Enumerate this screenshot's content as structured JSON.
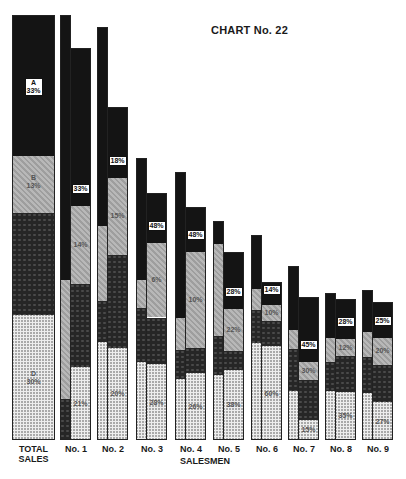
{
  "chart_data": {
    "type": "bar",
    "title": "CHART No. 22",
    "xlabel": "SALESMEN",
    "ylabel": "",
    "stacked": true,
    "segment_order_top_to_bottom": [
      "A",
      "B",
      "C",
      "D"
    ],
    "legend": [],
    "categories": [
      "TOTAL SALES",
      "No. 1",
      "No. 2",
      "No. 3",
      "No. 4",
      "No. 5",
      "No. 6",
      "No. 7",
      "No. 8",
      "No. 9"
    ],
    "series": [
      {
        "name": "A",
        "values": [
          33,
          33,
          18,
          48,
          48,
          28,
          14,
          45,
          28,
          25
        ]
      },
      {
        "name": "B",
        "values": [
          13,
          14,
          15,
          6,
          10,
          22,
          10,
          30,
          12,
          20
        ]
      },
      {
        "name": "C",
        "values": [
          24,
          32,
          47,
          18,
          16,
          12,
          16,
          10,
          25,
          28
        ]
      },
      {
        "name": "D",
        "values": [
          30,
          21,
          20,
          28,
          26,
          38,
          60,
          15,
          35,
          27
        ]
      }
    ],
    "labels": {
      "total_sales": [
        "A 33%",
        "B 13%",
        "",
        "D 30%"
      ],
      "No. 1": [
        "33%",
        "14%",
        "",
        "21%"
      ],
      "No. 2": [
        "18%",
        "15%",
        "",
        "20%"
      ],
      "No. 3": [
        "48%",
        "6%",
        "",
        "28%"
      ],
      "No. 4": [
        "48%",
        "10%",
        "",
        "26%"
      ],
      "No. 5": [
        "28%",
        "22%",
        "",
        "38%"
      ],
      "No. 6": [
        "14%",
        "10%",
        "",
        "60%"
      ],
      "No. 7": [
        "45%",
        "30%",
        "",
        "15%"
      ],
      "No. 8": [
        "28%",
        "12%",
        "",
        "35%"
      ],
      "No. 9": [
        "25%",
        "20%",
        "",
        "27%"
      ]
    }
  },
  "title": "CHART No. 22",
  "xaxis_label": "SALESMEN",
  "total_label": [
    "TOTAL",
    "SALES"
  ],
  "bars": [
    {
      "name": "No. 1",
      "narrow": {
        "top": 15,
        "segs": [
          [
            "A",
            0,
            0.62
          ],
          [
            "B",
            0.62,
            0.9
          ],
          [
            "C",
            0.9,
            1.0
          ]
        ]
      },
      "wide": {
        "top": 48,
        "segs": [
          [
            "A",
            0,
            0.4
          ],
          [
            "B",
            0.4,
            0.6
          ],
          [
            "C",
            0.6,
            0.81
          ],
          [
            "D",
            0.81,
            1.0
          ]
        ]
      },
      "l1": "33%",
      "l2": "14%",
      "l4": "21%"
    },
    {
      "name": "No. 2",
      "narrow": {
        "top": 27,
        "segs": [
          [
            "A",
            0,
            0.48
          ],
          [
            "B",
            0.48,
            0.66
          ],
          [
            "C",
            0.66,
            0.76
          ],
          [
            "D",
            0.76,
            1.0
          ]
        ]
      },
      "wide": {
        "top": 107,
        "segs": [
          [
            "A",
            0,
            0.21
          ],
          [
            "B",
            0.21,
            0.44
          ],
          [
            "C",
            0.44,
            0.72
          ],
          [
            "D",
            0.72,
            1.0
          ]
        ]
      },
      "l1": "18%",
      "l2": "15%",
      "l4": "20%"
    },
    {
      "name": "No. 3",
      "narrow": {
        "top": 158,
        "segs": [
          [
            "A",
            0,
            0.43
          ],
          [
            "B",
            0.43,
            0.53
          ],
          [
            "C",
            0.53,
            0.72
          ],
          [
            "D",
            0.72,
            1.0
          ]
        ]
      },
      "wide": {
        "top": 193,
        "segs": [
          [
            "A",
            0,
            0.2
          ],
          [
            "B",
            0.2,
            0.5
          ],
          [
            "C",
            0.5,
            0.69
          ],
          [
            "D",
            0.69,
            1.0
          ]
        ]
      },
      "l1": "48%",
      "l2": "6%",
      "l4": "28%"
    },
    {
      "name": "No. 4",
      "narrow": {
        "top": 172,
        "segs": [
          [
            "A",
            0,
            0.54
          ],
          [
            "B",
            0.54,
            0.66
          ],
          [
            "C",
            0.66,
            0.77
          ],
          [
            "D",
            0.77,
            1.0
          ]
        ]
      },
      "wide": {
        "top": 207,
        "segs": [
          [
            "A",
            0,
            0.19
          ],
          [
            "B",
            0.19,
            0.6
          ],
          [
            "C",
            0.6,
            0.71
          ],
          [
            "D",
            0.71,
            1.0
          ]
        ]
      },
      "l1": "48%",
      "l2": "10%",
      "l4": "26%"
    },
    {
      "name": "No. 5",
      "narrow": {
        "top": 221,
        "segs": [
          [
            "A",
            0,
            0.1
          ],
          [
            "B",
            0.1,
            0.52
          ],
          [
            "C",
            0.52,
            0.7
          ],
          [
            "D",
            0.7,
            1.0
          ]
        ]
      },
      "wide": {
        "top": 252,
        "segs": [
          [
            "A",
            0,
            0.3
          ],
          [
            "B",
            0.3,
            0.52
          ],
          [
            "C",
            0.52,
            0.62
          ],
          [
            "D",
            0.62,
            1.0
          ]
        ]
      },
      "l1": "28%",
      "l2": "22%",
      "l4": "38%"
    },
    {
      "name": "No. 6",
      "narrow": {
        "top": 235,
        "segs": [
          [
            "A",
            0,
            0.26
          ],
          [
            "B",
            0.26,
            0.36
          ],
          [
            "C",
            0.36,
            0.52
          ],
          [
            "D",
            0.52,
            1.0
          ]
        ]
      },
      "wide": {
        "top": 282,
        "segs": [
          [
            "A",
            0,
            0.14
          ],
          [
            "B",
            0.14,
            0.24
          ],
          [
            "C",
            0.24,
            0.4
          ],
          [
            "D",
            0.4,
            1.0
          ]
        ]
      },
      "l1": "14%",
      "l2": "10%",
      "l4": "60%"
    },
    {
      "name": "No. 7",
      "narrow": {
        "top": 266,
        "segs": [
          [
            "A",
            0,
            0.36
          ],
          [
            "B",
            0.36,
            0.47
          ],
          [
            "C",
            0.47,
            0.71
          ],
          [
            "D",
            0.71,
            1.0
          ]
        ]
      },
      "wide": {
        "top": 297,
        "segs": [
          [
            "A",
            0,
            0.45
          ],
          [
            "B",
            0.45,
            0.57
          ],
          [
            "C",
            0.57,
            0.85
          ],
          [
            "D",
            0.85,
            1.0
          ]
        ]
      },
      "l1": "45%",
      "l2": "30%",
      "l4": "15%"
    },
    {
      "name": "No. 8",
      "narrow": {
        "top": 293,
        "segs": [
          [
            "A",
            0,
            0.3
          ],
          [
            "B",
            0.3,
            0.46
          ],
          [
            "C",
            0.46,
            0.66
          ],
          [
            "D",
            0.66,
            1.0
          ]
        ]
      },
      "wide": {
        "top": 299,
        "segs": [
          [
            "A",
            0,
            0.28
          ],
          [
            "B",
            0.28,
            0.4
          ],
          [
            "C",
            0.4,
            0.65
          ],
          [
            "D",
            0.65,
            1.0
          ]
        ]
      },
      "l1": "28%",
      "l2": "12%",
      "l4": "35%"
    },
    {
      "name": "No. 9",
      "narrow": {
        "top": 290,
        "segs": [
          [
            "A",
            0,
            0.27
          ],
          [
            "B",
            0.27,
            0.44
          ],
          [
            "C",
            0.44,
            0.68
          ],
          [
            "D",
            0.68,
            1.0
          ]
        ]
      },
      "wide": {
        "top": 302,
        "segs": [
          [
            "A",
            0,
            0.25
          ],
          [
            "B",
            0.25,
            0.45
          ],
          [
            "C",
            0.45,
            0.72
          ],
          [
            "D",
            0.72,
            1.0
          ]
        ]
      },
      "l1": "25%",
      "l2": "20%",
      "l4": "27%"
    }
  ]
}
